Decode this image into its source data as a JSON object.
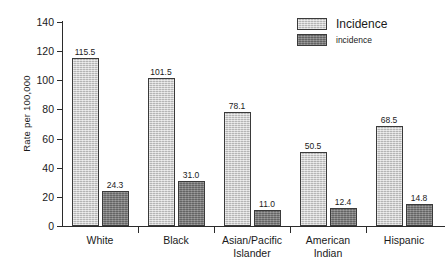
{
  "chart_data": {
    "type": "bar",
    "title": "",
    "xlabel": "",
    "ylabel": "Rate per 100,000",
    "ylim": [
      0,
      140
    ],
    "yticks": [
      0,
      20,
      40,
      60,
      80,
      100,
      120,
      140
    ],
    "grid": false,
    "legend_position": "top-right",
    "categories": [
      "White",
      "Asian/Pacific Islander",
      "Black",
      "American Indian",
      "Hispanic"
    ],
    "category_lines": [
      [
        "White"
      ],
      [
        "Black"
      ],
      [
        "Asian/Pacific",
        "Islander"
      ],
      [
        "American",
        "Indian"
      ],
      [
        "Hispanic"
      ]
    ],
    "category_order": [
      "White",
      "Black",
      "Asian/Pacific Islander",
      "American Indian",
      "Hispanic"
    ],
    "series": [
      {
        "name": "Incidence",
        "color": "#c9c9c9",
        "values": [
          115.5,
          101.5,
          78.1,
          50.5,
          68.5
        ],
        "labels": [
          "115.5",
          "101.5",
          "78.1",
          "50.5",
          "68.5"
        ]
      },
      {
        "name": "incidence",
        "color": "#7c7c7c",
        "values": [
          24.3,
          31.0,
          11.0,
          12.4,
          14.8
        ],
        "labels": [
          "24.3",
          "31.0",
          "11.0",
          "12.4",
          "14.8"
        ]
      }
    ]
  },
  "axis": {
    "y_title": "Rate per 100,000",
    "tick_labels": [
      "140",
      "120",
      "100",
      "80",
      "60",
      "40",
      "20",
      "0"
    ]
  },
  "legend": {
    "primary_label": "Incidence",
    "secondary_label": "incidence"
  },
  "colors": {
    "light_bar": "#c9c9c9",
    "dark_bar": "#7c7c7c",
    "outline": "#3a3a3a",
    "axis": "#2b2b2b",
    "text": "#1a1a1a",
    "background": "#ffffff"
  }
}
